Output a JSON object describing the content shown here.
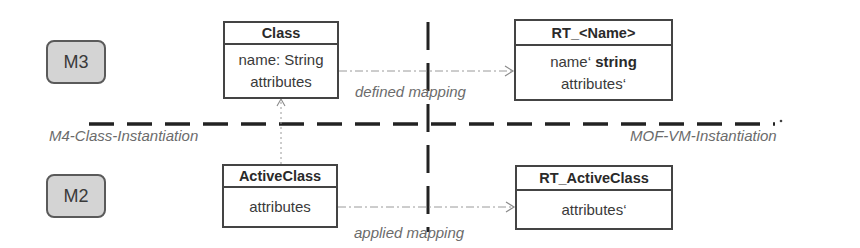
{
  "levels": {
    "m3": "M3",
    "m2": "M2"
  },
  "boxes": {
    "class": {
      "title": "Class",
      "attr1": "name: String",
      "attr2": "attributes"
    },
    "rt_name": {
      "title": "RT_<Name>",
      "attr1_prefix": "name‘ ",
      "attr1_bold": "string",
      "attr2": "attributes‘"
    },
    "active_class": {
      "title": "ActiveClass",
      "attr1": "attributes"
    },
    "rt_active_class": {
      "title": "RT_ActiveClass",
      "attr1": "attributes‘"
    }
  },
  "labels": {
    "defined_mapping": "defined mapping",
    "applied_mapping": "applied mapping",
    "m4_instantiation": "M4-Class-Instantiation",
    "mof_vm_instantiation": "MOF-VM-Instantiation"
  },
  "colors": {
    "badge_fill": "#d4d4d4",
    "box_border": "#444444",
    "dashed_line": "#222222",
    "mapping_line": "#9a9a9a",
    "label_gray": "#6b6b6b"
  }
}
